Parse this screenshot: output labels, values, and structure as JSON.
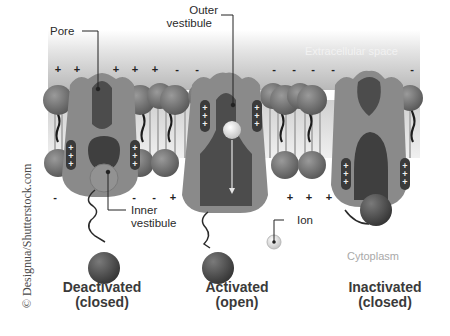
{
  "diagram": {
    "regions": {
      "extracellular": "Extracellular space",
      "cytoplasm": "Cytoplasm"
    },
    "callouts": {
      "pore": "Pore",
      "outer_vestibule_line1": "Outer",
      "outer_vestibule_line2": "vestibule",
      "inner_vestibule_line1": "Inner",
      "inner_vestibule_line2": "vestibule",
      "ion": "Ion"
    },
    "states": [
      {
        "line1": "Deactivated",
        "line2": "(closed)"
      },
      {
        "line1": "Activated",
        "line2": "(open)"
      },
      {
        "line1": "Inactivated",
        "line2": "(closed)"
      }
    ],
    "charges_top": [
      "+",
      "+",
      "+",
      "+",
      "+",
      "-",
      "-",
      "-",
      "-",
      "-",
      "-",
      "-"
    ],
    "charges_bottom": [
      "-",
      "-",
      "-",
      "+",
      "+",
      "+",
      "+"
    ],
    "sensor_charges": "+",
    "credit": "© Designua/Shutterstock.com",
    "colors": {
      "protein": "#8c8c8c",
      "protein_dark": "#4a4a4a",
      "lipid_head": "#6e6e6e",
      "extracellular_top": "#ffffff",
      "extracellular_bottom": "#bdbdbd",
      "ion": "#d8d8d8"
    }
  }
}
